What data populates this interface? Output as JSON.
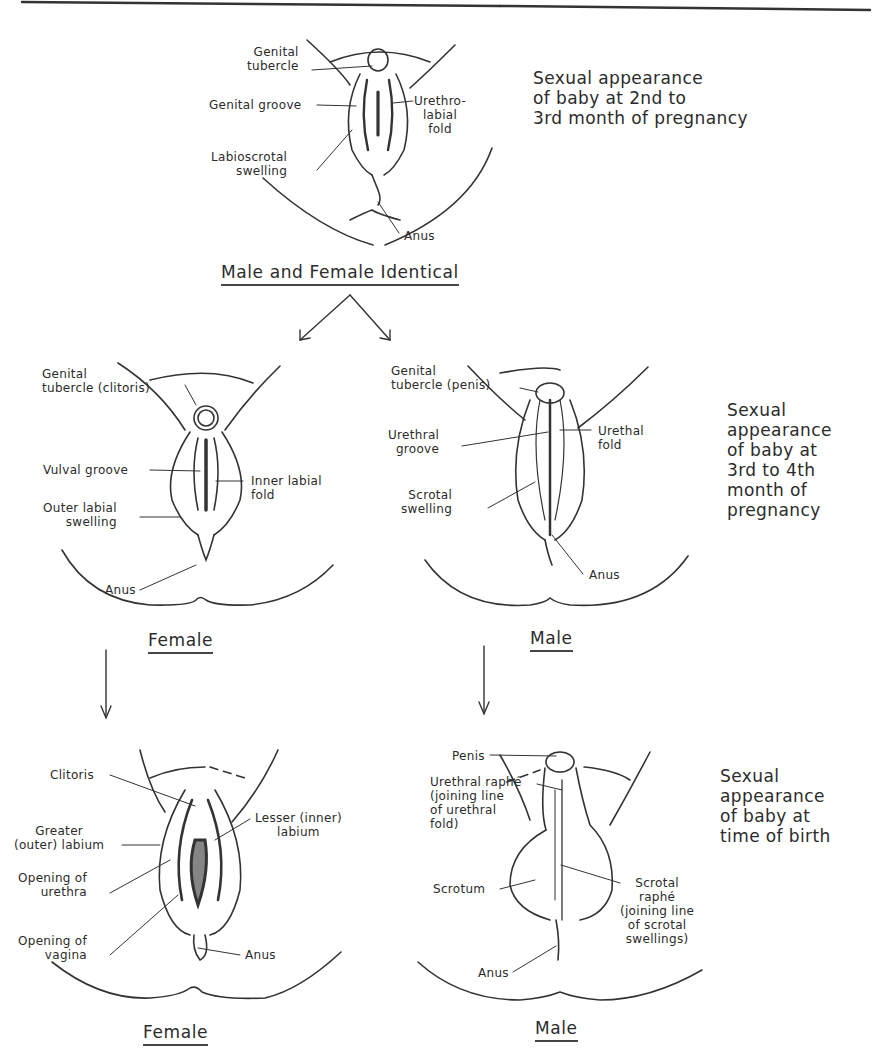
{
  "stage1": {
    "caption": "Sexual appearance\nof baby at 2nd to\n3rd month of pregnancy",
    "title": "Male and Female Identical",
    "labels": {
      "genital_tubercle": "Genital\ntubercle",
      "genital_groove": "Genital groove",
      "labioscrotal_swelling": "Labioscrotal\nswelling",
      "urethrolabial_fold": "Urethro-\nlabial\nfold",
      "anus": "Anus"
    }
  },
  "stage2": {
    "caption": "Sexual\nappearance\nof baby at\n3rd to 4th\nmonth of\npregnancy",
    "female": {
      "title": "Female",
      "labels": {
        "genital_tubercle": "Genital\ntubercle (clitoris)",
        "vulval_groove": "Vulval groove",
        "outer_labial_swelling": "Outer labial\nswelling",
        "inner_labial_fold": "Inner labial\nfold",
        "anus": "Anus"
      }
    },
    "male": {
      "title": "Male",
      "labels": {
        "genital_tubercle": "Genital\ntubercle (penis)",
        "urethral_groove": "Urethral\ngroove",
        "scrotal_swelling": "Scrotal\nswelling",
        "urethal_fold": "Urethal\nfold",
        "anus": "Anus"
      }
    }
  },
  "stage3": {
    "caption": "Sexual\nappearance\nof baby at\ntime of birth",
    "female": {
      "title": "Female",
      "labels": {
        "clitoris": "Clitoris",
        "greater_labium": "Greater\n(outer) labium",
        "opening_urethra": "Opening of\nurethra",
        "opening_vagina": "Opening of\nvagina",
        "lesser_labium": "Lesser (inner)\nlabium",
        "anus": "Anus"
      }
    },
    "male": {
      "title": "Male",
      "labels": {
        "penis": "Penis",
        "urethral_raphe": "Urethral raphé\n(joining line\nof urethral\nfold)",
        "scrotum": "Scrotum",
        "scrotal_raphe": "Scrotal\nraphé\n(joining line\nof scrotal\nswellings)",
        "anus": "Anus"
      }
    }
  }
}
